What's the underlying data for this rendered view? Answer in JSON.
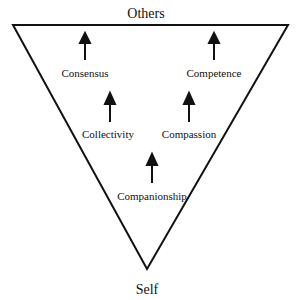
{
  "diagram": {
    "top_label": "Others",
    "bottom_label": "Self",
    "nodes": [
      {
        "id": "consensus",
        "label": "Consensus"
      },
      {
        "id": "competence",
        "label": "Competence"
      },
      {
        "id": "collectivity",
        "label": "Collectivity"
      },
      {
        "id": "compassion",
        "label": "Compassion"
      },
      {
        "id": "companionship",
        "label": "Companionship"
      }
    ]
  }
}
